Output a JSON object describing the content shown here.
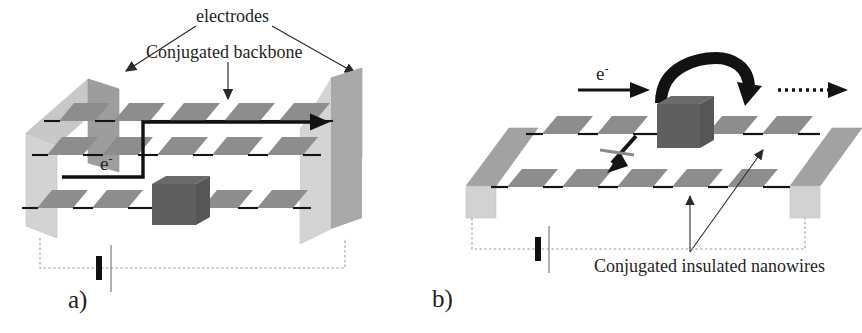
{
  "figure": {
    "background_color": "#ffffff"
  },
  "colors": {
    "segment_fill": "#8d8d8d",
    "segment_fill_light": "#9b9b9b",
    "electrode_front": "#d0d0d0",
    "electrode_top": "#9d9d9d",
    "electrode_side": "#c3c3c3",
    "molecule_block": "#5f5f5f",
    "bond_line": "#141414",
    "arrow_black": "#141414",
    "circuit_line": "#9a9a9a",
    "label_text": "#1f1f1f"
  },
  "panel_a": {
    "letter": "a)",
    "labels": {
      "electrodes": "electrodes",
      "backbone": "Conjugated backbone",
      "electron": "e",
      "electron_superscript": "-"
    },
    "structure": {
      "rows": 3,
      "segments_per_row": 5,
      "electrode_count": 2,
      "molecule_blocks": 1,
      "battery": true,
      "transport_path": "electron enters lower-left, steps up to top row, travels right to electrode",
      "transport_arrow": "solid-black-right"
    }
  },
  "panel_b": {
    "letter": "b)",
    "labels": {
      "electron": "e",
      "electron_superscript": "-",
      "nanowires": "Conjugated insulated nanowires"
    },
    "structure": {
      "rows": 2,
      "segments_per_row": 5,
      "electrode_count": 2,
      "molecule_blocks": 1,
      "battery": true,
      "incoming_arrow": "solid-black-right",
      "turnaround_arrow": "thick-curved-hook",
      "outgoing_arrow": "dotted-right",
      "blocked_arrow": "down-left-arrow-with-cross",
      "pointer_arrows": 2
    }
  }
}
